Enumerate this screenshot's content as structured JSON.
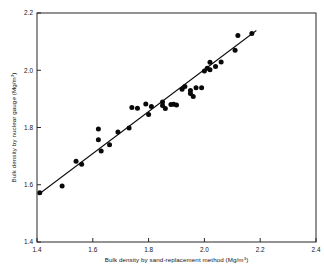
{
  "chart_data": {
    "type": "scatter",
    "title": "",
    "xlabel": "Bulk density by sand-replacement method (Mg/m3)",
    "xlabel_main": "Bulk density by sand-replacement method (Mg/m",
    "xlabel_sup": "3",
    "xlabel_tail": ")",
    "ylabel": "Bulk density by nuclear gauge (Mg/m3)",
    "ylabel_main": "Bulk density by nuclear gauge (Mg/m",
    "ylabel_sup": "3",
    "ylabel_tail": ")",
    "xlim": [
      1.4,
      2.4
    ],
    "ylim": [
      1.4,
      2.2
    ],
    "xticks": [
      "1.4",
      "1.6",
      "1.8",
      "2.0",
      "2.2",
      "2.4"
    ],
    "xtick_values": [
      1.4,
      1.6,
      1.8,
      2.0,
      2.2,
      2.4
    ],
    "yticks": [
      "1.4",
      "1.6",
      "1.8",
      "2.0",
      "2.2"
    ],
    "ytick_values": [
      1.4,
      1.6,
      1.8,
      2.0,
      2.2
    ],
    "grid": false,
    "legend": "none",
    "marker": "filled-circle",
    "marker_color": "#090909",
    "line_color": "#0d0d0d",
    "x": [
      1.41,
      1.49,
      1.54,
      1.56,
      1.62,
      1.62,
      1.63,
      1.66,
      1.69,
      1.73,
      1.74,
      1.76,
      1.79,
      1.8,
      1.81,
      1.85,
      1.85,
      1.86,
      1.88,
      1.89,
      1.9,
      1.92,
      1.93,
      1.95,
      1.95,
      1.96,
      1.97,
      1.99,
      2.0,
      2.01,
      2.02,
      2.02,
      2.04,
      2.06,
      2.11,
      2.12,
      2.17
    ],
    "y": [
      1.572,
      1.596,
      1.682,
      1.672,
      1.795,
      1.757,
      1.718,
      1.74,
      1.784,
      1.798,
      1.87,
      1.867,
      1.882,
      1.845,
      1.873,
      1.889,
      1.877,
      1.866,
      1.88,
      1.881,
      1.879,
      1.934,
      1.943,
      1.929,
      1.919,
      1.908,
      1.939,
      1.939,
      1.997,
      2.007,
      2.028,
      2.002,
      2.013,
      2.029,
      2.07,
      2.121,
      2.128
    ],
    "fit_line": {
      "x_start": 1.405,
      "y_start": 1.566,
      "x_end": 2.185,
      "y_end": 2.138
    },
    "series": [
      {
        "name": "Bulk density measurements",
        "points": [
          [
            1.41,
            1.572
          ],
          [
            1.49,
            1.596
          ],
          [
            1.54,
            1.682
          ],
          [
            1.56,
            1.672
          ],
          [
            1.62,
            1.795
          ],
          [
            1.62,
            1.757
          ],
          [
            1.63,
            1.718
          ],
          [
            1.66,
            1.74
          ],
          [
            1.69,
            1.784
          ],
          [
            1.73,
            1.798
          ],
          [
            1.74,
            1.87
          ],
          [
            1.76,
            1.867
          ],
          [
            1.79,
            1.882
          ],
          [
            1.8,
            1.845
          ],
          [
            1.81,
            1.873
          ],
          [
            1.85,
            1.889
          ],
          [
            1.85,
            1.877
          ],
          [
            1.86,
            1.866
          ],
          [
            1.88,
            1.88
          ],
          [
            1.89,
            1.881
          ],
          [
            1.9,
            1.879
          ],
          [
            1.92,
            1.934
          ],
          [
            1.93,
            1.943
          ],
          [
            1.95,
            1.929
          ],
          [
            1.95,
            1.919
          ],
          [
            1.96,
            1.908
          ],
          [
            1.97,
            1.939
          ],
          [
            1.99,
            1.939
          ],
          [
            2.0,
            1.997
          ],
          [
            2.01,
            2.007
          ],
          [
            2.02,
            2.028
          ],
          [
            2.02,
            2.002
          ],
          [
            2.04,
            2.013
          ],
          [
            2.06,
            2.029
          ],
          [
            2.11,
            2.07
          ],
          [
            2.12,
            2.121
          ],
          [
            2.17,
            2.128
          ]
        ]
      }
    ]
  }
}
